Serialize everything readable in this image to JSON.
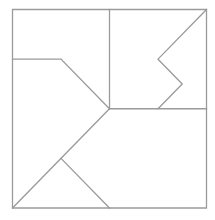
{
  "diagram": {
    "line_color": "#9a9a9a",
    "background_color": "#ffffff",
    "unit_grid": 4,
    "outer_square": [
      [
        0,
        0
      ],
      [
        4,
        0
      ],
      [
        4,
        4
      ],
      [
        0,
        4
      ]
    ],
    "segments": [
      {
        "name": "vertical-divider",
        "points": [
          [
            2,
            0
          ],
          [
            2,
            2
          ]
        ]
      },
      {
        "name": "horizontal-divider",
        "points": [
          [
            2,
            2
          ],
          [
            4,
            2
          ]
        ]
      },
      {
        "name": "left-bent-line",
        "points": [
          [
            0,
            1
          ],
          [
            1,
            1
          ],
          [
            2,
            2
          ]
        ]
      },
      {
        "name": "long-diagonal",
        "points": [
          [
            0,
            4
          ],
          [
            2,
            2
          ]
        ]
      },
      {
        "name": "lower-branch",
        "points": [
          [
            1,
            3
          ],
          [
            2,
            4
          ]
        ]
      },
      {
        "name": "zigzag-line",
        "points": [
          [
            4,
            0
          ],
          [
            3,
            1
          ],
          [
            3.5,
            1.5
          ],
          [
            3,
            2
          ]
        ]
      }
    ]
  }
}
